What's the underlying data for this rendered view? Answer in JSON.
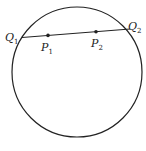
{
  "diagram": {
    "circle": {
      "cx": 77,
      "cy": 72,
      "r": 65,
      "stroke": "#222222"
    },
    "chord": {
      "from": "Q1",
      "to": "Q2"
    },
    "points": [
      {
        "id": "Q1",
        "base": "Q",
        "sub": "1",
        "x": 13,
        "y": 37
      },
      {
        "id": "P1",
        "base": "P",
        "sub": "1",
        "x": 48,
        "y": 35
      },
      {
        "id": "P2",
        "base": "P",
        "sub": "2",
        "x": 96,
        "y": 31
      },
      {
        "id": "Q2",
        "base": "Q",
        "sub": "2",
        "x": 130,
        "y": 29
      }
    ],
    "labels": {
      "q1": {
        "base": "Q",
        "sub": "1"
      },
      "p1": {
        "base": "P",
        "sub": "1"
      },
      "p2": {
        "base": "P",
        "sub": "2"
      },
      "q2": {
        "base": "Q",
        "sub": "2"
      }
    }
  }
}
